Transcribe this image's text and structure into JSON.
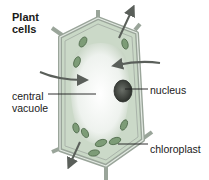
{
  "diagram": {
    "title_line1": "Plant",
    "title_line2": "cells",
    "labels": {
      "central_vacuole_line1": "central",
      "central_vacuole_line2": "vacuole",
      "nucleus": "nucleus",
      "chloroplast": "chloroplast"
    },
    "colors": {
      "cell_wall": "#9aa59a",
      "wall_highlight": "#dfe6df",
      "cytoplasm": "#c9d8c6",
      "vacuole": "#f2f5f2",
      "chloroplast": "#6f8f6a",
      "nucleus": "#3b4038",
      "arrow": "#5a5f5a",
      "leader_line": "#1a1a1a"
    },
    "arrows": [
      {
        "name": "water-out-top",
        "direction": "up-right"
      },
      {
        "name": "water-in-left",
        "direction": "right"
      },
      {
        "name": "water-in-right",
        "direction": "left"
      },
      {
        "name": "water-out-bottom",
        "direction": "down-left"
      }
    ]
  }
}
